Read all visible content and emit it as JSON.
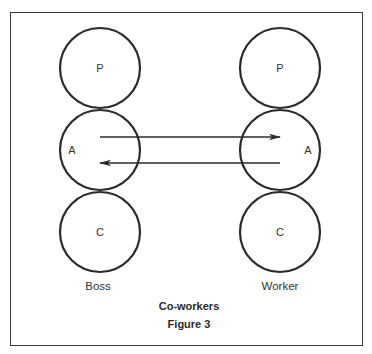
{
  "figure": {
    "title": "Co-workers",
    "caption": "Figure 3"
  },
  "columns": [
    {
      "name": "Boss",
      "states": [
        {
          "key": "parent",
          "label": "P"
        },
        {
          "key": "adult",
          "label": "A"
        },
        {
          "key": "child",
          "label": "C"
        }
      ]
    },
    {
      "name": "Worker",
      "states": [
        {
          "key": "parent",
          "label": "P"
        },
        {
          "key": "adult",
          "label": "A"
        },
        {
          "key": "child",
          "label": "C"
        }
      ]
    }
  ],
  "transactions": [
    {
      "from": "Boss.A",
      "to": "Worker.A",
      "direction": "right"
    },
    {
      "from": "Worker.A",
      "to": "Boss.A",
      "direction": "left"
    }
  ],
  "colors": {
    "stroke": "#2b2b2b",
    "frame": "#3a3a3a",
    "background": "#ffffff"
  }
}
